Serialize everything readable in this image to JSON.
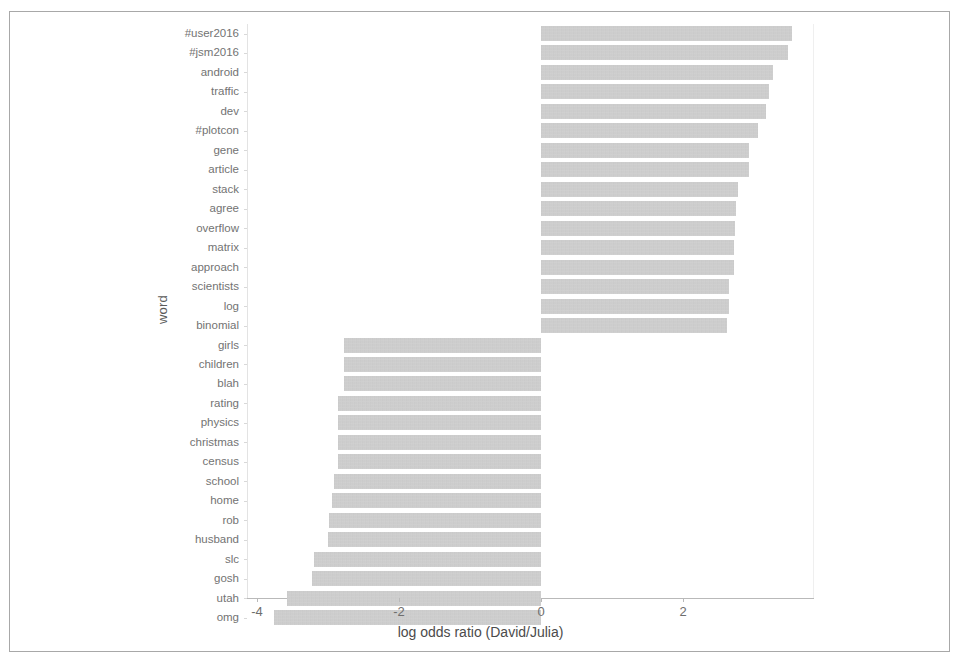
{
  "chart_data": {
    "type": "bar",
    "orientation": "horizontal",
    "title": "",
    "xlabel": "log odds ratio (David/Julia)",
    "ylabel": "word",
    "xlim": [
      -4.0,
      3.7
    ],
    "xticks": [
      -4,
      -2,
      0,
      2
    ],
    "xtick_labels": [
      "-4",
      "-2",
      "0",
      "2"
    ],
    "grid": false,
    "legend": null,
    "bar_color": "#c9c9c9",
    "categories": [
      "#user2016",
      "#jsm2016",
      "android",
      "traffic",
      "dev",
      "#plotcon",
      "gene",
      "article",
      "stack",
      "agree",
      "overflow",
      "matrix",
      "approach",
      "scientists",
      "log",
      "binomial",
      "girls",
      "children",
      "blah",
      "rating",
      "physics",
      "christmas",
      "census",
      "school",
      "home",
      "rob",
      "husband",
      "slc",
      "gosh",
      "utah",
      "omg"
    ],
    "values": [
      3.53,
      3.48,
      3.27,
      3.21,
      3.17,
      3.06,
      2.93,
      2.93,
      2.77,
      2.75,
      2.73,
      2.72,
      2.72,
      2.65,
      2.65,
      2.62,
      -2.77,
      -2.77,
      -2.77,
      -2.86,
      -2.86,
      -2.86,
      -2.86,
      -2.92,
      -2.94,
      -2.99,
      -3.0,
      -3.2,
      -3.23,
      -3.58,
      -3.76
    ]
  },
  "axis": {
    "y_title": "word",
    "x_title": "log odds ratio (David/Julia)"
  }
}
